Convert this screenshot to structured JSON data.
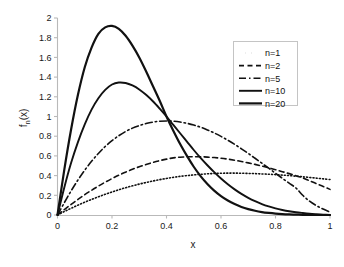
{
  "figure": {
    "background_color": "#ffffff",
    "line_color": "#111111",
    "axis_color": "#b9b9b9"
  },
  "chart_data": {
    "type": "line",
    "title": "",
    "subtitle": "",
    "xlabel": "x",
    "ylabel": "f_n(x)",
    "ylabel_display": "f",
    "ylabel_sub": "n",
    "ylabel_tail": "(x)",
    "xlim": [
      0,
      1
    ],
    "ylim": [
      0,
      2
    ],
    "grid": false,
    "legend_position": "upper right",
    "xticks": [
      0,
      0.2,
      0.4,
      0.6,
      0.8,
      1
    ],
    "xtick_labels": [
      "0",
      "0.2",
      "0.4",
      "0.6",
      "0.8",
      "1"
    ],
    "yticks": [
      0,
      0.2,
      0.4,
      0.6,
      0.8,
      1,
      1.2,
      1.4,
      1.6,
      1.8,
      2
    ],
    "ytick_labels": [
      "0",
      "0.2",
      "0.4",
      "0.6",
      "0.8",
      "1",
      "1.2",
      "1.4",
      "1.6",
      "1.8",
      "2"
    ],
    "x": [
      0,
      0.025,
      0.05,
      0.075,
      0.1,
      0.125,
      0.15,
      0.175,
      0.2,
      0.225,
      0.25,
      0.275,
      0.3,
      0.325,
      0.35,
      0.375,
      0.4,
      0.425,
      0.45,
      0.475,
      0.5,
      0.525,
      0.55,
      0.575,
      0.6,
      0.625,
      0.65,
      0.675,
      0.7,
      0.725,
      0.75,
      0.775,
      0.8,
      0.825,
      0.85,
      0.875,
      0.9,
      0.925,
      0.95,
      0.975,
      1
    ],
    "series": [
      {
        "name": "n=1",
        "label": "n=1",
        "linestyle": "dotted",
        "linewidth": 1.6,
        "dasharray": "1,2.2",
        "peak_x": 0.62,
        "peak_y": 0.425,
        "value_at_1": 0.36,
        "values": [
          0.0,
          0.035,
          0.068,
          0.1,
          0.13,
          0.158,
          0.185,
          0.21,
          0.234,
          0.256,
          0.277,
          0.296,
          0.314,
          0.33,
          0.345,
          0.359,
          0.371,
          0.382,
          0.392,
          0.4,
          0.407,
          0.413,
          0.418,
          0.421,
          0.424,
          0.425,
          0.425,
          0.424,
          0.422,
          0.42,
          0.417,
          0.414,
          0.41,
          0.405,
          0.4,
          0.394,
          0.388,
          0.381,
          0.374,
          0.367,
          0.36
        ]
      },
      {
        "name": "n=2",
        "label": "n=2",
        "linestyle": "dashed",
        "linewidth": 1.6,
        "dasharray": "5,3.5",
        "peak_x": 0.505,
        "peak_y": 0.592,
        "value_at_1": 0.26,
        "values": [
          0.0,
          0.055,
          0.108,
          0.158,
          0.206,
          0.251,
          0.293,
          0.333,
          0.37,
          0.404,
          0.435,
          0.464,
          0.49,
          0.513,
          0.534,
          0.552,
          0.567,
          0.58,
          0.587,
          0.591,
          0.592,
          0.591,
          0.588,
          0.583,
          0.576,
          0.567,
          0.556,
          0.543,
          0.529,
          0.514,
          0.497,
          0.479,
          0.46,
          0.44,
          0.42,
          0.399,
          0.377,
          0.348,
          0.318,
          0.29,
          0.26
        ]
      },
      {
        "name": "n=5",
        "label": "n=5",
        "linestyle": "dashdot",
        "linewidth": 1.6,
        "dasharray": "7,3,1.5,3",
        "peak_x": 0.335,
        "peak_y": 0.955,
        "value_at_1": 0.03,
        "values": [
          0.0,
          0.125,
          0.245,
          0.355,
          0.455,
          0.545,
          0.625,
          0.695,
          0.755,
          0.805,
          0.848,
          0.882,
          0.908,
          0.928,
          0.943,
          0.952,
          0.955,
          0.952,
          0.944,
          0.931,
          0.913,
          0.891,
          0.864,
          0.833,
          0.798,
          0.759,
          0.717,
          0.672,
          0.625,
          0.576,
          0.526,
          0.475,
          0.424,
          0.373,
          0.323,
          0.274,
          0.2,
          0.14,
          0.095,
          0.06,
          0.03
        ]
      },
      {
        "name": "n=10",
        "label": "n=10",
        "linestyle": "solid",
        "linewidth": 1.9,
        "dasharray": "none",
        "peak_x": 0.22,
        "peak_y": 1.345,
        "value_at_1": 0.0,
        "values": [
          0.0,
          0.28,
          0.53,
          0.74,
          0.92,
          1.07,
          1.185,
          1.27,
          1.325,
          1.345,
          1.34,
          1.315,
          1.275,
          1.22,
          1.155,
          1.08,
          1.0,
          0.915,
          0.83,
          0.745,
          0.66,
          0.58,
          0.505,
          0.435,
          0.37,
          0.312,
          0.26,
          0.214,
          0.174,
          0.14,
          0.111,
          0.087,
          0.067,
          0.051,
          0.038,
          0.028,
          0.02,
          0.013,
          0.008,
          0.004,
          0.0
        ]
      },
      {
        "name": "n=20",
        "label": "n=20",
        "linestyle": "solid",
        "linewidth": 2.2,
        "dasharray": "none",
        "peak_x": 0.155,
        "peak_y": 1.92,
        "value_at_1": 0.0,
        "values": [
          0.0,
          0.46,
          0.87,
          1.22,
          1.5,
          1.7,
          1.84,
          1.905,
          1.92,
          1.89,
          1.82,
          1.72,
          1.6,
          1.46,
          1.31,
          1.16,
          1.0,
          0.855,
          0.72,
          0.6,
          0.49,
          0.395,
          0.315,
          0.248,
          0.192,
          0.147,
          0.111,
          0.082,
          0.06,
          0.043,
          0.03,
          0.021,
          0.014,
          0.009,
          0.006,
          0.004,
          0.002,
          0.001,
          0.0,
          0.0,
          0.0
        ]
      }
    ]
  }
}
